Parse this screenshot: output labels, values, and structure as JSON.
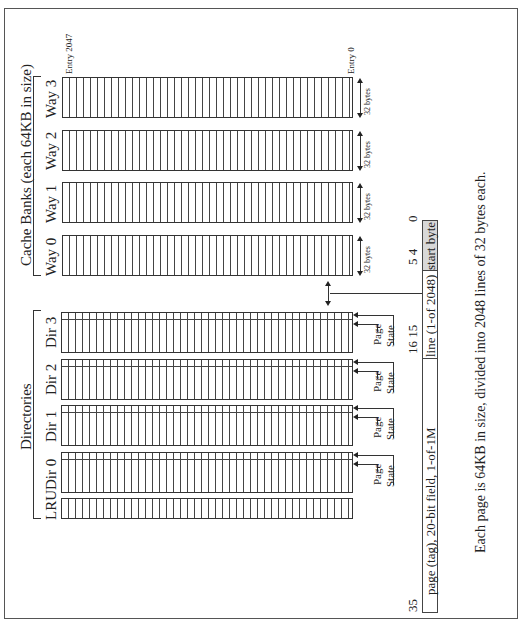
{
  "orientation": "rotated-90-ccw",
  "cache_banks": {
    "title": "Cache Banks (each 64KB in size)",
    "ways": [
      {
        "label": "Way 3",
        "line_size": "32 bytes"
      },
      {
        "label": "Way 2",
        "line_size": "32 bytes"
      },
      {
        "label": "Way 1",
        "line_size": "32 bytes"
      },
      {
        "label": "Way 0",
        "line_size": "32 bytes"
      }
    ],
    "entry_top": "Entry 2047",
    "entry_bottom": "Entry 0"
  },
  "directories": {
    "title": "Directories",
    "dirs": [
      {
        "label": "Dir 3",
        "page_label": "Page",
        "state_label": "State"
      },
      {
        "label": "Dir 2",
        "page_label": "Page",
        "state_label": "State"
      },
      {
        "label": "Dir 1",
        "page_label": "Page",
        "state_label": "State"
      },
      {
        "label": "Dir 0",
        "page_label": "Page",
        "state_label": "State"
      }
    ],
    "lru_label": "LRU"
  },
  "address": {
    "bit_35": "35",
    "bits_16_15": "16 15",
    "bits_5_4": "5 4",
    "bit_0": "0",
    "fields": [
      {
        "label": "page (tag), 20-bit field, 1-of-1M",
        "shaded": false
      },
      {
        "label": "line (1-of 2048)",
        "shaded": false
      },
      {
        "label": "start byte",
        "shaded": true
      }
    ]
  },
  "caption": "Each page is 64KB in size, divided into 2048 lines of 32 bytes each."
}
